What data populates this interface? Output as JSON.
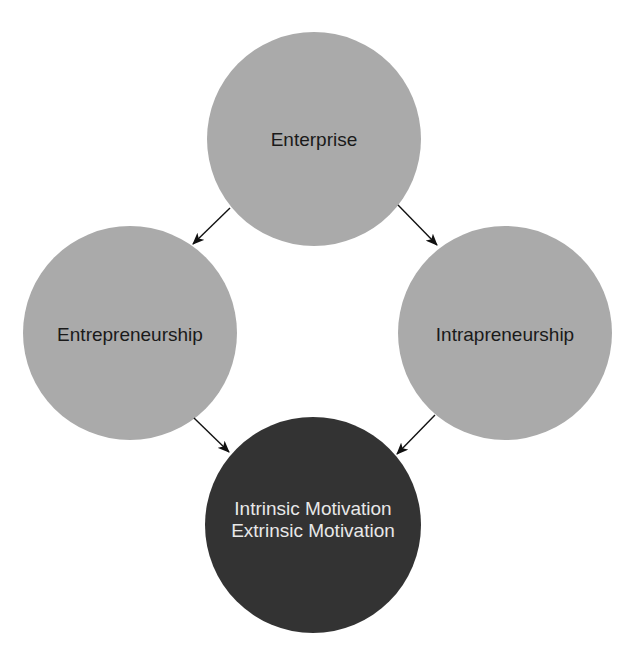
{
  "diagram": {
    "type": "concept-flow",
    "colors": {
      "background": "#ffffff",
      "light_node_fill": "#aaaaaa",
      "dark_node_fill": "#333333",
      "light_text": "#1a1a1a",
      "dark_text": "#e8e8e8",
      "arrow": "#111111"
    },
    "nodes": {
      "enterprise": {
        "label": "Enterprise"
      },
      "entrepreneurship": {
        "label": "Entrepreneurship"
      },
      "intrapreneurship": {
        "label": "Intrapreneurship"
      },
      "motivation": {
        "line1": "Intrinsic Motivation",
        "line2": "Extrinsic Motivation"
      }
    },
    "edges": [
      {
        "from": "Enterprise",
        "to": "Entrepreneurship"
      },
      {
        "from": "Enterprise",
        "to": "Intrapreneurship"
      },
      {
        "from": "Entrepreneurship",
        "to": "Intrinsic Motivation / Extrinsic Motivation"
      },
      {
        "from": "Intrapreneurship",
        "to": "Intrinsic Motivation / Extrinsic Motivation"
      }
    ]
  }
}
